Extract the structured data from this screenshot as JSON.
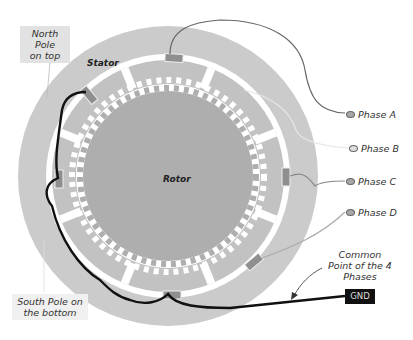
{
  "diagram": {
    "type": "stepper-motor-cross-section",
    "parts": {
      "stator": "Stator",
      "rotor": "Rotor"
    },
    "annotations": {
      "north_pole": [
        "North Pole",
        "on top"
      ],
      "south_pole": [
        "South Pole on",
        "the bottom"
      ],
      "common_point": [
        "Common",
        "Point of the 4",
        "Phases"
      ]
    },
    "phases": [
      {
        "label": "Phase A"
      },
      {
        "label": "Phase B"
      },
      {
        "label": "Phase C"
      },
      {
        "label": "Phase D"
      }
    ],
    "ground": {
      "label": "GND"
    },
    "colors": {
      "stator": "#c9c9c9",
      "stator_inner": "#bfbfbf",
      "rotor": "#aeaeae",
      "gap": "#ffffff",
      "wire_main": "#111111",
      "wire_phase": "#777777",
      "gnd_box": "#111111"
    }
  }
}
